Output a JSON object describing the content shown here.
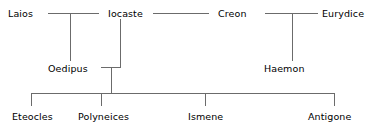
{
  "diagram": {
    "type": "genealogy-tree",
    "line_color": "#6b6b6b",
    "text_color": "#000000",
    "background": "#ffffff",
    "generations": [
      {
        "index": 1,
        "members": [
          {
            "id": "laios",
            "label": "Laios"
          },
          {
            "id": "iocaste",
            "label": "Iocaste"
          },
          {
            "id": "creon",
            "label": "Creon"
          },
          {
            "id": "eurydice",
            "label": "Eurydice"
          }
        ]
      },
      {
        "index": 2,
        "members": [
          {
            "id": "oedipus",
            "label": "Oedipus"
          },
          {
            "id": "haemon",
            "label": "Haemon"
          }
        ]
      },
      {
        "index": 3,
        "members": [
          {
            "id": "eteocles",
            "label": "Eteocles"
          },
          {
            "id": "polyneices",
            "label": "Polyneices"
          },
          {
            "id": "ismene",
            "label": "Ismene"
          },
          {
            "id": "antigone",
            "label": "Antigone"
          }
        ]
      }
    ],
    "unions": [
      {
        "partners": [
          "laios",
          "iocaste"
        ],
        "children": [
          "oedipus"
        ]
      },
      {
        "partners": [
          "creon",
          "eurydice"
        ],
        "children": [
          "haemon"
        ]
      },
      {
        "partners": [
          "oedipus",
          "iocaste"
        ],
        "children": [
          "eteocles",
          "polyneices",
          "ismene",
          "antigone"
        ]
      }
    ],
    "spouse_links": [
      {
        "left": "iocaste",
        "right": "creon"
      }
    ]
  }
}
